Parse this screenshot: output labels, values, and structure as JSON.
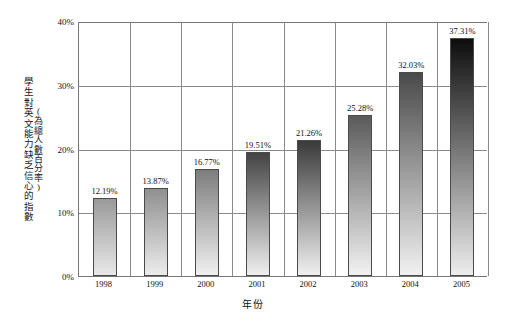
{
  "chart_data": {
    "type": "bar",
    "title": "",
    "xlabel": "年份",
    "ylabel": "學生對英文能力缺乏信心的指數",
    "ylabel_sub": "(為總人數百分率)",
    "categories": [
      "1998",
      "1999",
      "2000",
      "2001",
      "2002",
      "2003",
      "2004",
      "2005"
    ],
    "values": [
      12.19,
      13.87,
      16.77,
      19.51,
      21.26,
      25.28,
      32.03,
      37.31
    ],
    "value_labels": [
      "12.19%",
      "13.87%",
      "16.77%",
      "19.51%",
      "21.26%",
      "25.28%",
      "32.03%",
      "37.31%"
    ],
    "ylim": [
      0,
      40
    ],
    "yticks": [
      0,
      10,
      20,
      30,
      40
    ],
    "ytick_labels": [
      "0%",
      "10%",
      "20%",
      "30%",
      "40%"
    ],
    "grid": true,
    "legend": "none",
    "bar_gradient_tops": [
      "#9a9a9a",
      "#8f8f8f",
      "#7d7d7d",
      "#434343",
      "#3a3a3a",
      "#5a5a5a",
      "#4a4a4a",
      "#0d0d0d"
    ],
    "bar_gradient_bottoms": [
      "#e8e8e8",
      "#ececec",
      "#f0f0f0",
      "#efefef",
      "#f0f0f0",
      "#f2f2f2",
      "#f1f1f1",
      "#ededed"
    ]
  },
  "axis": {
    "y_title_main": "學生對英文能力缺乏信心的指數",
    "y_title_sub": "(為總人數百分率)",
    "x_title": "年份"
  },
  "colors": {
    "axis_line": "#777777",
    "gridline": "#8a8a8a",
    "bar_border": "#4a4a4a",
    "text": "#111111",
    "background": "#ffffff"
  }
}
